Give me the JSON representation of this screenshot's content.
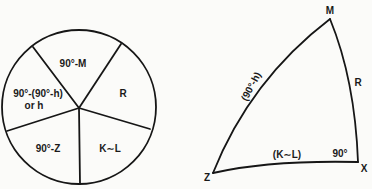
{
  "napier_circle": {
    "parts": [
      {
        "id": "top",
        "label": "90°-M"
      },
      {
        "id": "right",
        "label": "R"
      },
      {
        "id": "bottom-right",
        "label": "K∼L"
      },
      {
        "id": "bottom-left",
        "label": "90°-Z"
      },
      {
        "id": "left",
        "label_line1": "90°-(90°-h)",
        "label_line2": "or h"
      }
    ]
  },
  "spherical_triangle": {
    "vertices": {
      "M": "M",
      "X": "X",
      "Z": "Z"
    },
    "sides": {
      "ZM": "(90°-h)",
      "MX": "R",
      "ZX": "(K∼L)"
    },
    "angle_at_X": "90°"
  }
}
